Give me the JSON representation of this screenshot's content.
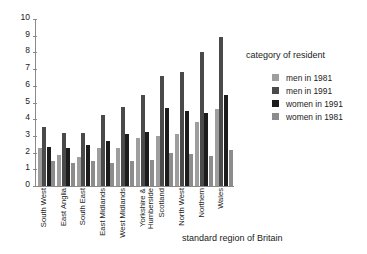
{
  "chart_data": {
    "type": "bar",
    "title": "",
    "xlabel": "standard region of Britain",
    "ylabel": "",
    "ylim": [
      0,
      10
    ],
    "yticks": [
      0,
      1,
      2,
      3,
      4,
      5,
      6,
      7,
      8,
      9,
      10
    ],
    "grid": false,
    "legend_position": "right",
    "legend_title": "category of resident",
    "categories": [
      "South West",
      "East Anglia",
      "South East",
      "East Midlands",
      "West Midlands",
      "Yorkshire & Humberside",
      "Scotland",
      "North West",
      "Northern",
      "Wales"
    ],
    "series": [
      {
        "name": "men in 1981",
        "color": "#9e9e9e",
        "values": [
          2.25,
          1.85,
          1.75,
          2.25,
          2.3,
          2.9,
          3.0,
          3.1,
          3.85,
          4.6
        ]
      },
      {
        "name": "men in 1991",
        "color": "#4a4a4a",
        "values": [
          3.55,
          3.15,
          3.15,
          4.25,
          4.75,
          5.45,
          6.6,
          6.85,
          8.0,
          8.9
        ]
      },
      {
        "name": "women in 1991",
        "color": "#1c1c1c",
        "values": [
          2.35,
          2.25,
          2.45,
          2.7,
          3.1,
          3.25,
          4.7,
          4.5,
          4.4,
          5.45
        ]
      },
      {
        "name": "women in 1981",
        "color": "#8c8c8c",
        "values": [
          1.5,
          1.35,
          1.5,
          1.4,
          1.5,
          1.55,
          2.0,
          1.9,
          1.8,
          2.15
        ]
      }
    ]
  }
}
